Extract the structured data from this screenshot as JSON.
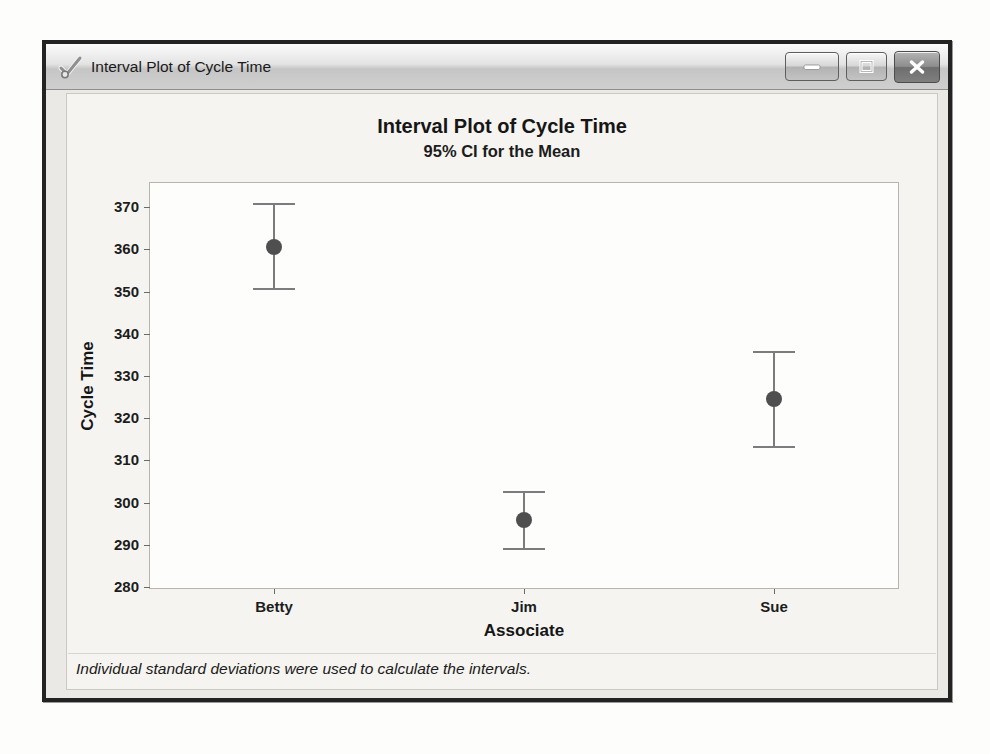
{
  "window": {
    "title": "Interval Plot of Cycle Time",
    "icon": "minitab-graph-check-icon",
    "controls": [
      "minimize",
      "maximize",
      "close"
    ]
  },
  "chart_data": {
    "type": "scatter",
    "subtype": "interval-plot-errorbars",
    "title": "Interval Plot of Cycle Time",
    "subtitle": "95% CI for the Mean",
    "xlabel": "Associate",
    "ylabel": "Cycle Time",
    "categories": [
      "Betty",
      "Jim",
      "Sue"
    ],
    "points": [
      {
        "category": "Betty",
        "mean": 360.7,
        "ci_low": 350.6,
        "ci_high": 370.9
      },
      {
        "category": "Jim",
        "mean": 295.9,
        "ci_low": 289.0,
        "ci_high": 302.4
      },
      {
        "category": "Sue",
        "mean": 324.5,
        "ci_low": 313.1,
        "ci_high": 335.6
      }
    ],
    "yticks": [
      280,
      290,
      300,
      310,
      320,
      330,
      340,
      350,
      360,
      370
    ],
    "ylim": [
      279.5,
      376
    ],
    "grid": false,
    "legend": "none",
    "footnote": "Individual standard deviations were used to calculate the intervals."
  },
  "colors": {
    "content_bg": "#ebe9e5",
    "region_bg": "#f5f4f1",
    "plot_bg": "#fdfdfc",
    "interval": "#7c7c7c",
    "dot": "#4f4f4f",
    "text": "#1d1d1d",
    "close_button": "#8d8d8d"
  }
}
